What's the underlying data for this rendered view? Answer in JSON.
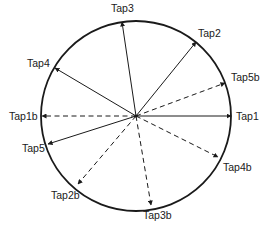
{
  "diagram": {
    "type": "phasor-tap-circle",
    "circle": {
      "cx": 136,
      "cy": 116,
      "r": 95,
      "stroke": "#1a1a1a"
    },
    "center": {
      "x": 136,
      "y": 116
    },
    "taps": [
      {
        "id": "tap3",
        "label": "Tap3",
        "style": "solid",
        "x": 122,
        "y": 22,
        "lx": 111,
        "ly": 12,
        "anchor": "start"
      },
      {
        "id": "tap2",
        "label": "Tap2",
        "style": "solid",
        "x": 196,
        "y": 42,
        "lx": 198,
        "ly": 37,
        "anchor": "start"
      },
      {
        "id": "tap5b",
        "label": "Tap5b",
        "style": "dashed",
        "x": 225,
        "y": 83,
        "lx": 231,
        "ly": 81,
        "anchor": "start"
      },
      {
        "id": "tap1",
        "label": "Tap1",
        "style": "solid",
        "x": 231,
        "y": 116,
        "lx": 236,
        "ly": 120,
        "anchor": "start"
      },
      {
        "id": "tap4b",
        "label": "Tap4b",
        "style": "dashed",
        "x": 218,
        "y": 157,
        "lx": 223,
        "ly": 171,
        "anchor": "start"
      },
      {
        "id": "tap3b",
        "label": "Tap3b",
        "style": "dashed",
        "x": 151,
        "y": 205,
        "lx": 143,
        "ly": 219,
        "anchor": "start"
      },
      {
        "id": "tap2b",
        "label": "Tap2b",
        "style": "dashed",
        "x": 78,
        "y": 184,
        "lx": 51,
        "ly": 199,
        "anchor": "start"
      },
      {
        "id": "tap5",
        "label": "Tap5",
        "style": "solid",
        "x": 48,
        "y": 144,
        "lx": 22,
        "ly": 152,
        "anchor": "start"
      },
      {
        "id": "tap1b",
        "label": "Tap1b",
        "style": "dashed",
        "x": 42,
        "y": 116,
        "lx": 9,
        "ly": 120,
        "anchor": "start"
      },
      {
        "id": "tap4",
        "label": "Tap4",
        "style": "solid",
        "x": 55,
        "y": 68,
        "lx": 27,
        "ly": 67,
        "anchor": "start"
      }
    ]
  }
}
